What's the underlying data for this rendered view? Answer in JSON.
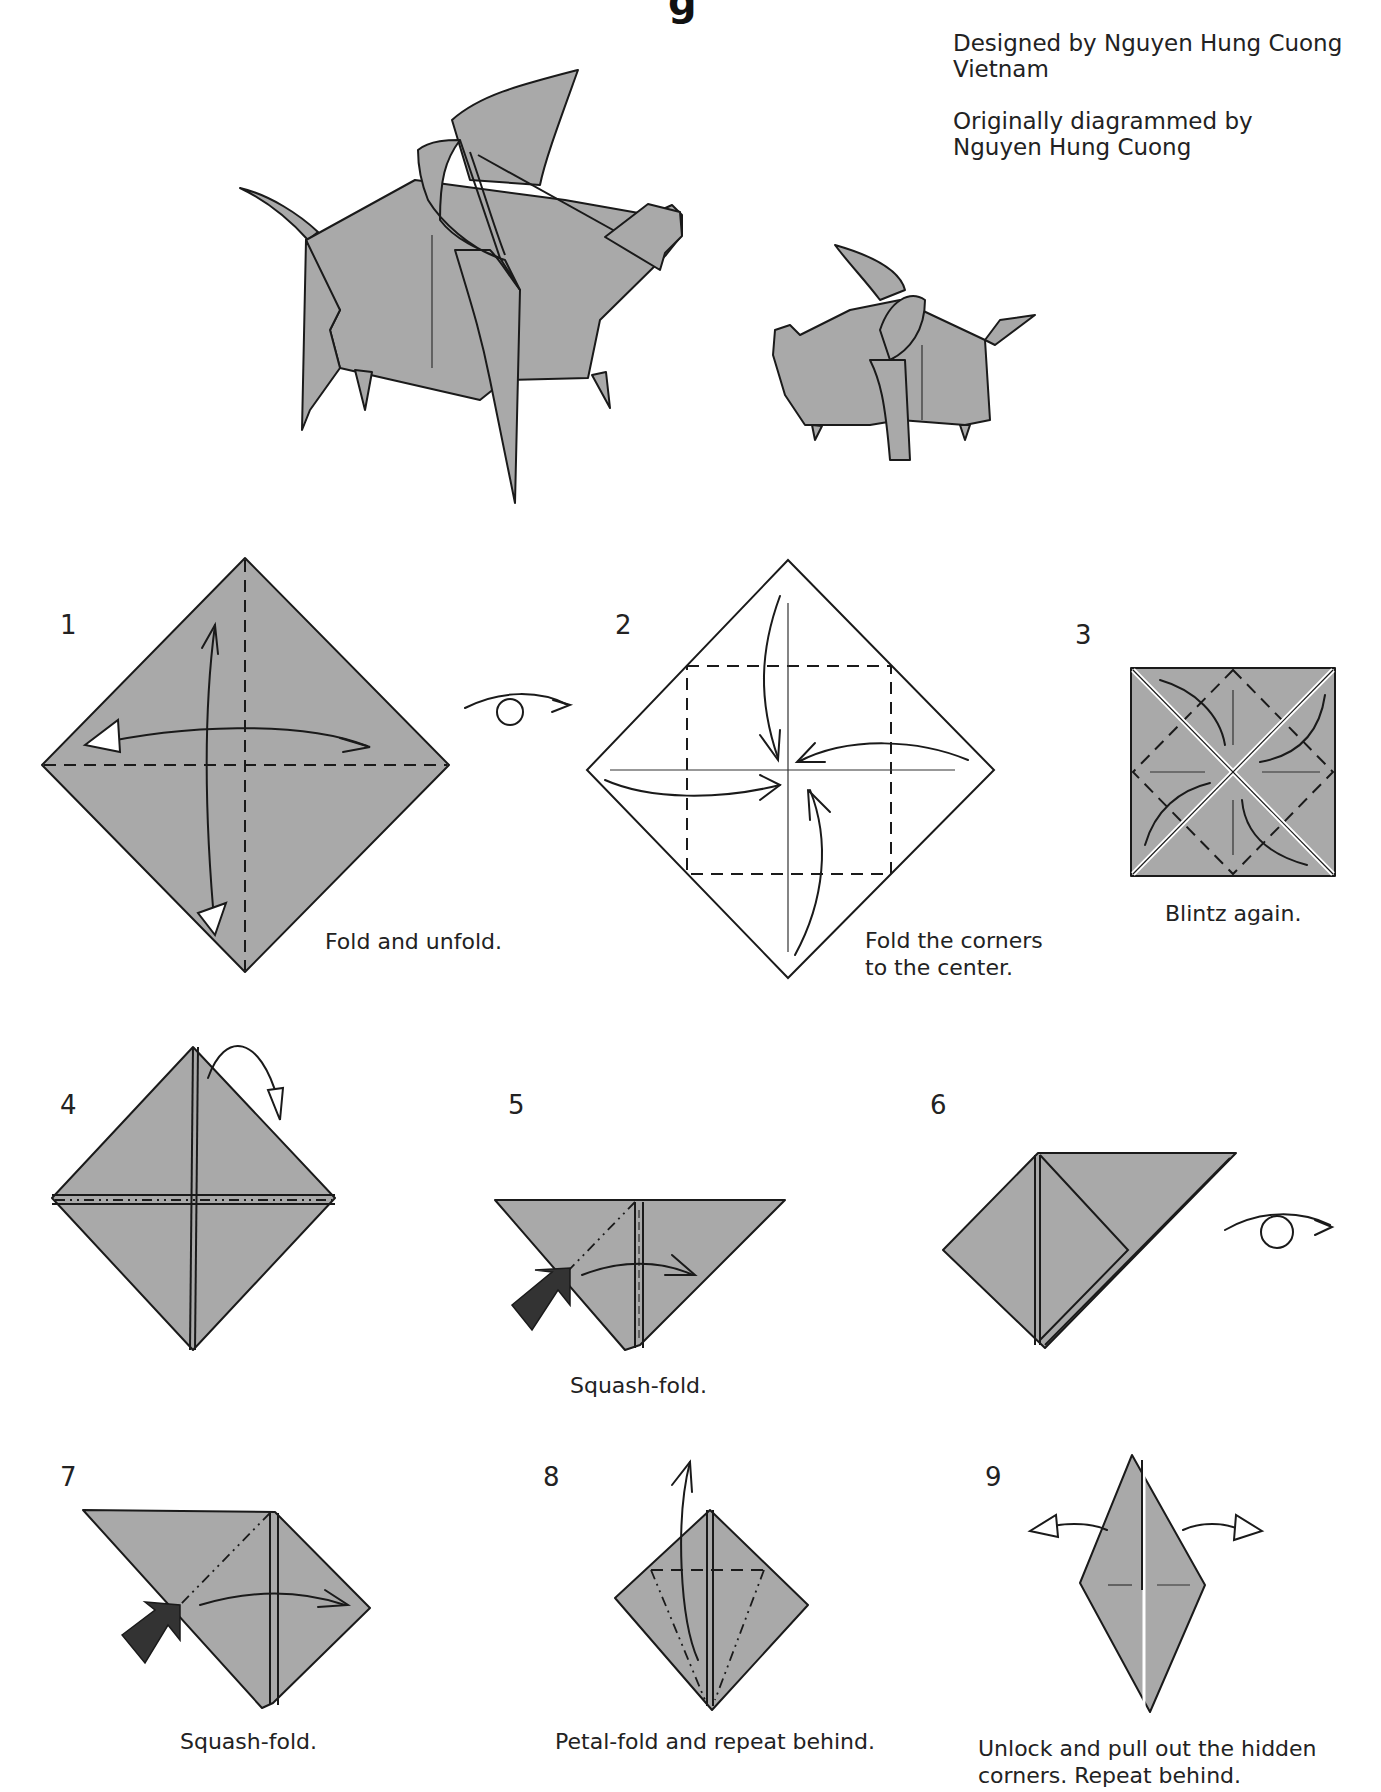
{
  "header": {
    "title_fragment": "g",
    "credits": {
      "designed_by": "Designed by Nguyen Hung Cuong",
      "country": "Vietnam",
      "diagrammed_label": "Originally diagrammed by",
      "diagrammed_by": "Nguyen Hung Cuong"
    }
  },
  "figures": {
    "large_model": "finished-pig-large",
    "small_model": "finished-pig-small"
  },
  "steps": [
    {
      "number": "1",
      "caption": "Fold and unfold."
    },
    {
      "number": "2",
      "caption_line1": "Fold the corners",
      "caption_line2": "to the center."
    },
    {
      "number": "3",
      "caption": "Blintz again."
    },
    {
      "number": "4",
      "caption": ""
    },
    {
      "number": "5",
      "caption": "Squash-fold."
    },
    {
      "number": "6",
      "caption": ""
    },
    {
      "number": "7",
      "caption": "Squash-fold."
    },
    {
      "number": "8",
      "caption": "Petal-fold and repeat behind."
    },
    {
      "number": "9",
      "caption_line1": "Unlock and pull out the hidden",
      "caption_line2": "corners. Repeat behind."
    }
  ],
  "colors": {
    "paper_gray": "#a9a9a9",
    "line": "#1a1a1a",
    "background": "#ffffff"
  },
  "symbols": {
    "turn_over_1": "turn-over-icon",
    "turn_over_6": "turn-over-icon",
    "push_arrow": "push-arrow-icon"
  }
}
